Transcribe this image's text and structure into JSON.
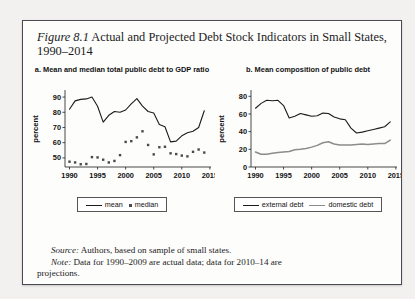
{
  "figure": {
    "label": "Figure 8.1",
    "title": "Actual and Projected Debt Stock Indicators in Small States, 1990–2014",
    "source_label": "Source:",
    "source_text": " Authors, based on sample of small states.",
    "note_label": "Note:",
    "note_text": " Data for 1990–2009 are actual data; data for 2010–14 are",
    "note_text2": "projections."
  },
  "colors": {
    "mean_line": "#1b1b1b",
    "median_dot": "#4a4a4a",
    "external_debt": "#1b1b1b",
    "domestic_debt": "#8c8c8c",
    "axis": "#333333",
    "frame": "#4a4a55",
    "page_bg": "#f2f1ef",
    "figure_bg": "#fdfdfc"
  },
  "chart_data": [
    {
      "type": "line",
      "panel": "a",
      "title": "a. Mean and median total public debt to GDP ratio",
      "xlabel": "",
      "ylabel": "percent",
      "xlim": [
        1989.2,
        2015.2
      ],
      "ylim": [
        44,
        94
      ],
      "xticks": [
        1990,
        1995,
        2000,
        2005,
        2010,
        2015
      ],
      "yticks": [
        50,
        60,
        70,
        80,
        90
      ],
      "grid": false,
      "legend_position": "bottom",
      "series": [
        {
          "name": "mean",
          "style": "line",
          "x": [
            1990,
            1991,
            1992,
            1993,
            1994,
            1995,
            1996,
            1997,
            1998,
            1999,
            2000,
            2001,
            2002,
            2003,
            2004,
            2005,
            2006,
            2007,
            2008,
            2009,
            2010,
            2011,
            2012,
            2013,
            2014
          ],
          "values": [
            82.0,
            87.5,
            88.5,
            88.8,
            90.0,
            84.0,
            73.5,
            78.0,
            80.5,
            80.0,
            81.5,
            85.5,
            89.0,
            84.0,
            80.5,
            79.5,
            72.0,
            70.5,
            60.5,
            61.0,
            64.5,
            66.5,
            67.5,
            70.0,
            81.0
          ]
        },
        {
          "name": "median",
          "style": "scatter",
          "x": [
            1990,
            1991,
            1992,
            1993,
            1994,
            1995,
            1996,
            1997,
            1998,
            1999,
            2000,
            2001,
            2002,
            2003,
            2004,
            2005,
            2006,
            2007,
            2008,
            2009,
            2010,
            2011,
            2012,
            2013,
            2014
          ],
          "values": [
            47.5,
            47.0,
            45.8,
            46.0,
            50.5,
            50.3,
            48.8,
            47.0,
            48.0,
            51.8,
            60.5,
            61.0,
            63.5,
            67.5,
            58.5,
            52.3,
            57.0,
            57.3,
            53.0,
            52.5,
            51.5,
            51.0,
            54.0,
            55.5,
            53.5
          ]
        }
      ]
    },
    {
      "type": "line",
      "panel": "b",
      "title": "b. Mean composition of public debt",
      "xlabel": "",
      "ylabel": "percent",
      "xlim": [
        1989.2,
        2015.2
      ],
      "ylim": [
        0,
        86
      ],
      "xticks": [
        1990,
        1995,
        2000,
        2005,
        2010,
        2015
      ],
      "yticks": [
        0,
        20,
        40,
        60,
        80
      ],
      "grid": false,
      "legend_position": "bottom",
      "series": [
        {
          "name": "external debt",
          "style": "line",
          "x": [
            1990,
            1991,
            1992,
            1993,
            1994,
            1995,
            1996,
            1997,
            1998,
            1999,
            2000,
            2001,
            2002,
            2003,
            2004,
            2005,
            2006,
            2007,
            2008,
            2009,
            2010,
            2011,
            2012,
            2013,
            2014
          ],
          "values": [
            66.5,
            72.0,
            75.5,
            75.0,
            75.5,
            69.5,
            55.5,
            57.5,
            60.5,
            59.0,
            57.5,
            58.0,
            61.0,
            60.5,
            56.5,
            54.5,
            53.5,
            44.0,
            38.5,
            39.5,
            41.0,
            42.5,
            44.0,
            45.5,
            51.0
          ]
        },
        {
          "name": "domestic debt",
          "style": "line",
          "x": [
            1990,
            1991,
            1992,
            1993,
            1994,
            1995,
            1996,
            1997,
            1998,
            1999,
            2000,
            2001,
            2002,
            2003,
            2004,
            2005,
            2006,
            2007,
            2008,
            2009,
            2010,
            2011,
            2012,
            2013,
            2014
          ],
          "values": [
            17.0,
            14.5,
            14.5,
            15.5,
            16.5,
            17.0,
            17.5,
            19.5,
            20.0,
            21.0,
            22.5,
            24.5,
            27.5,
            28.5,
            26.0,
            25.0,
            25.0,
            25.0,
            25.5,
            26.0,
            25.5,
            26.0,
            26.5,
            26.5,
            30.5
          ]
        }
      ]
    }
  ],
  "legends": {
    "left": [
      {
        "label": "mean",
        "marker": "line"
      },
      {
        "label": "median",
        "marker": "dot"
      }
    ],
    "right": [
      {
        "label": "external debt",
        "marker": "line"
      },
      {
        "label": "domestic debt",
        "marker": "line-grey"
      }
    ]
  }
}
